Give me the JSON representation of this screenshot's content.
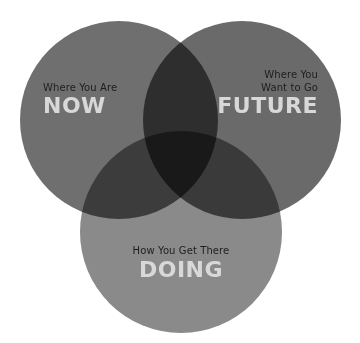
{
  "diagram": {
    "type": "venn",
    "circles": [
      {
        "id": "now",
        "subtitle": "Where You Are",
        "title": "NOW",
        "color": "#6f6f6f"
      },
      {
        "id": "future",
        "subtitle_line1": "Where You",
        "subtitle_line2": "Want to Go",
        "title": "FUTURE",
        "color": "#656565"
      },
      {
        "id": "doing",
        "subtitle": "How You Get There",
        "title": "DOING",
        "color": "#858585"
      }
    ]
  }
}
